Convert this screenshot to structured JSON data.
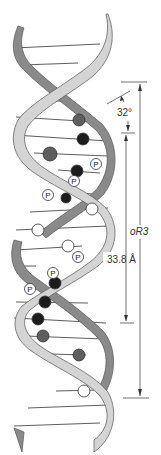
{
  "figure": {
    "colors": {
      "front_strand": "#d4d4d4",
      "back_strand": "#8a8a8a",
      "strand_outline": "#555555",
      "rung": "#333333",
      "base_dark_gray": "#5e5e5e",
      "base_black": "#1c1c1c",
      "base_white": "#ffffff",
      "phosphate_fill": "#ffffff",
      "annotation": "#333333"
    }
  },
  "annotations": {
    "angle_label": "32°",
    "rise_label": "33.8 Å",
    "pitch_label": "oR3"
  },
  "phosphates": {
    "p1": "P",
    "p2": "P",
    "p3": "P",
    "p4": "P",
    "p5": "P",
    "p6": "P"
  },
  "bases": [
    {
      "cx": 79,
      "cy": 120,
      "r": 6,
      "kind": "dark_gray"
    },
    {
      "cx": 83,
      "cy": 139,
      "r": 6,
      "kind": "black"
    },
    {
      "cx": 50,
      "cy": 154,
      "r": 7,
      "kind": "dark_gray"
    },
    {
      "cx": 77,
      "cy": 171,
      "r": 6,
      "kind": "black"
    },
    {
      "cx": 66,
      "cy": 198,
      "r": 5,
      "kind": "black"
    },
    {
      "cx": 92,
      "cy": 209,
      "r": 6,
      "kind": "white"
    },
    {
      "cx": 38,
      "cy": 230,
      "r": 6,
      "kind": "white"
    },
    {
      "cx": 68,
      "cy": 246,
      "r": 6,
      "kind": "white"
    },
    {
      "cx": 55,
      "cy": 283,
      "r": 6,
      "kind": "black"
    },
    {
      "cx": 45,
      "cy": 302,
      "r": 6,
      "kind": "black"
    },
    {
      "cx": 38,
      "cy": 319,
      "r": 6,
      "kind": "black"
    },
    {
      "cx": 43,
      "cy": 336,
      "r": 6,
      "kind": "dark_gray"
    },
    {
      "cx": 79,
      "cy": 355,
      "r": 6,
      "kind": "dark_gray"
    },
    {
      "cx": 84,
      "cy": 391,
      "r": 6,
      "kind": "white"
    }
  ]
}
